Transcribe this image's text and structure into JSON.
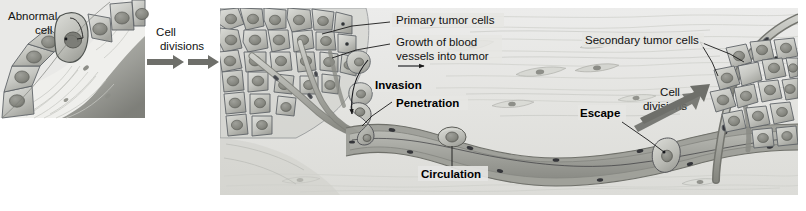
{
  "figure": {
    "domain": "Diagram",
    "background_color": "#ffffff"
  },
  "panels": [
    {
      "id": "left-panel",
      "name": "abnormal-cell-panel",
      "x": 0,
      "y": 0,
      "width": 145,
      "height": 118,
      "background_color": "#e9e9e7"
    },
    {
      "id": "main-panel",
      "name": "metastasis-panel",
      "x": 220,
      "y": 8,
      "width": 578,
      "height": 187,
      "background_color": "#e6e6e3"
    }
  ],
  "labels": {
    "abnormal_cell_line1": "Abnormal",
    "abnormal_cell_line2": "cell",
    "cell_divisions_left_line1": "Cell",
    "cell_divisions_left_line2": "divisions",
    "primary_tumor_cells": "Primary tumor cells",
    "growth_blood_vessels_line1": "Growth of blood",
    "growth_blood_vessels_line2": "vessels into tumor",
    "invasion": "Invasion",
    "penetration": "Penetration",
    "circulation": "Circulation",
    "escape": "Escape",
    "cell_divisions_right_line1": "Cell",
    "cell_divisions_right_line2": "divisions",
    "secondary_tumor_cells": "Secondary tumor cells"
  },
  "colors": {
    "panel_left_bg": "#e9e9e7",
    "panel_main_bg": "#e6e6e3",
    "cell_fill_light": "#d2d3cf",
    "cell_fill_mid": "#bfc0bb",
    "cell_fill_dark": "#a9aaa4",
    "nucleus_fill": "#8e8f89",
    "nucleus_stroke": "#6a6b66",
    "cell_outline": "#5f6368",
    "vessel_fill": "#b4b5b0",
    "vessel_dark": "#8a8b85",
    "tissue_fill": "#ededea",
    "tissue_stroke": "#c9cac5",
    "arrow_fill": "#6e6f6a",
    "text": "#111111",
    "leader_line": "#1a1a1a"
  },
  "arrows": [
    {
      "name": "cell-divisions-arrow-1",
      "x1": 148,
      "y1": 62,
      "x2": 182,
      "y2": 62,
      "direction": "right"
    },
    {
      "name": "cell-divisions-arrow-2",
      "x1": 186,
      "y1": 62,
      "x2": 218,
      "y2": 62,
      "direction": "right"
    },
    {
      "name": "growth-vessel-arrow",
      "x1": 400,
      "y1": 66,
      "x2": 432,
      "y2": 66,
      "direction": "right"
    },
    {
      "name": "invasion-arrow",
      "x1": 370,
      "y1": 62,
      "x2": 352,
      "y2": 120,
      "direction": "curved-down-left"
    },
    {
      "name": "cell-divisions-right-arrow-1",
      "x1": 668,
      "y1": 116,
      "x2": 718,
      "y2": 86,
      "direction": "up-right"
    },
    {
      "name": "cell-divisions-right-arrow-2",
      "x1": 672,
      "y1": 124,
      "x2": 722,
      "y2": 94,
      "direction": "up-right"
    }
  ],
  "leaders": [
    {
      "name": "abnormal-cell-leader",
      "from_x": 70,
      "from_y": 18,
      "to_x": 84,
      "to_y": 40
    },
    {
      "name": "primary-tumor-leader",
      "from_x": 392,
      "from_y": 22,
      "to_x": 322,
      "to_y": 34
    },
    {
      "name": "growth-vessels-leader",
      "from_x": 392,
      "from_y": 44,
      "to_x": 330,
      "to_y": 60
    },
    {
      "name": "penetration-leader",
      "from_x": 392,
      "from_y": 102,
      "to_x": 362,
      "to_y": 128
    },
    {
      "name": "circulation-leader",
      "from_x": 452,
      "from_y": 172,
      "to_x": 452,
      "to_y": 146
    },
    {
      "name": "escape-leader",
      "from_x": 628,
      "from_y": 124,
      "to_x": 668,
      "to_y": 148
    },
    {
      "name": "secondary-tumor-leader-a",
      "from_x": 702,
      "from_y": 42,
      "to_x": 742,
      "to_y": 62
    },
    {
      "name": "secondary-tumor-leader-b",
      "from_x": 702,
      "from_y": 42,
      "to_x": 716,
      "to_y": 76
    }
  ],
  "cells": {
    "epithelium_count": 6,
    "abnormal_cell_index": 3,
    "primary_tumor_cell_count": 38,
    "secondary_tumor_cell_count": 19,
    "circulating_cell_count": 3
  }
}
